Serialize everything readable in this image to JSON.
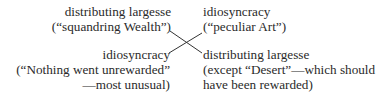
{
  "diagram": {
    "type": "chiasmus-cross",
    "top_left": {
      "lines": [
        "distributing largesse",
        "(“squandring Wealth”)"
      ]
    },
    "top_right": {
      "lines": [
        "idiosyncracy",
        "(“peculiar Art”)"
      ]
    },
    "bottom_left": {
      "lines": [
        "idiosyncracy",
        "(“Nothing went unrewarded”",
        "—most unusual)"
      ]
    },
    "bottom_right": {
      "lines": [
        "distributing largesse",
        "(except “Desert”—which should",
        "have been rewarded)"
      ]
    },
    "connections": [
      {
        "from": "top_left",
        "to": "bottom_right"
      },
      {
        "from": "top_right",
        "to": "bottom_left"
      }
    ],
    "colors": {
      "text": "#2a2a2a",
      "line": "#333333",
      "background": "#ffffff"
    }
  }
}
